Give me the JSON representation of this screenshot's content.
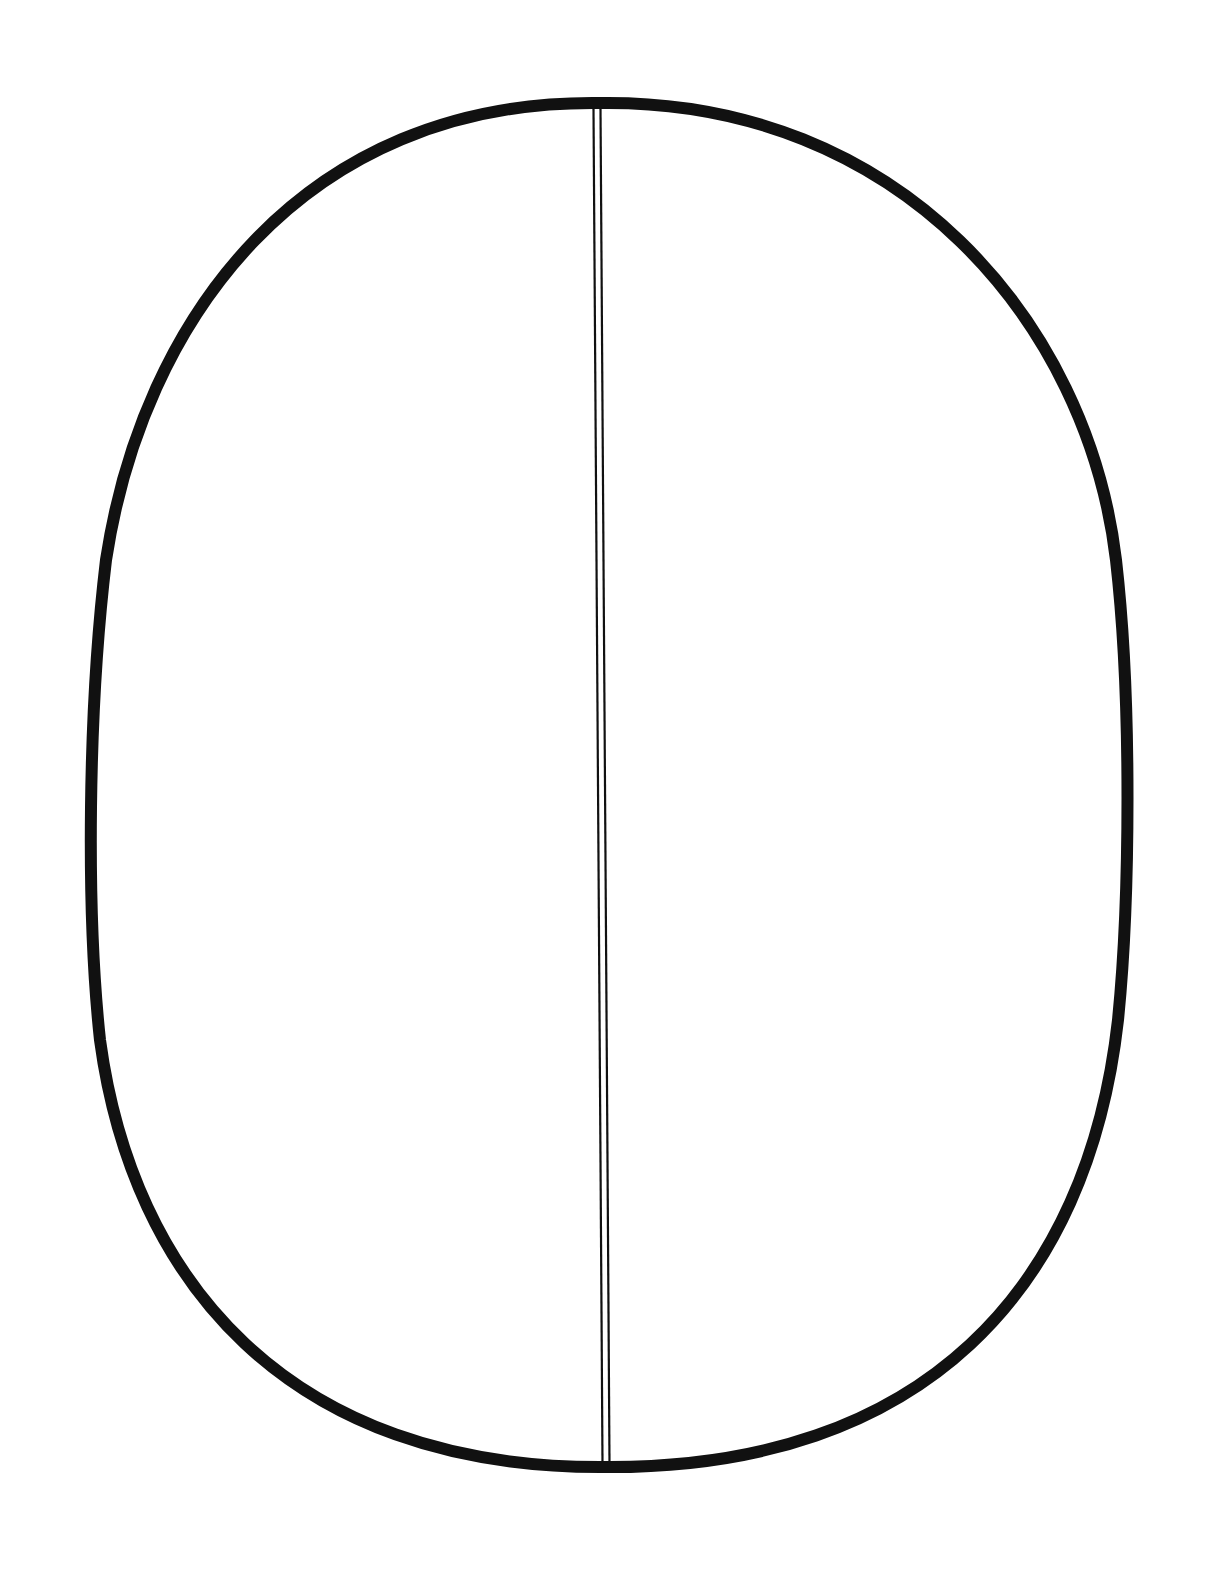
{
  "diagram": {
    "kind": "outline-drawing",
    "background_color": "#ffffff",
    "stroke_color": "#111111",
    "shape": {
      "name": "egg-oval",
      "left_x": 92,
      "right_x": 1128,
      "top_y": 103,
      "bottom_y": 1467,
      "outline_width": 12
    },
    "divider": {
      "name": "vertical-double-line",
      "top": {
        "x": 597,
        "y": 109
      },
      "bottom": {
        "x": 606,
        "y": 1462
      },
      "gap": 7,
      "line_width": 2.2
    },
    "regions": [
      {
        "id": "left-half",
        "label": ""
      },
      {
        "id": "right-half",
        "label": ""
      }
    ]
  }
}
